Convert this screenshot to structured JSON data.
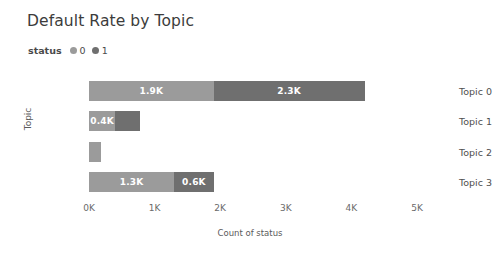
{
  "chart_data": {
    "type": "bar",
    "orientation": "horizontal",
    "stacked": true,
    "title": "Default Rate by Topic",
    "xlabel": "Count of status",
    "ylabel": "Topic",
    "categories": [
      "Topic 0",
      "Topic 1",
      "Topic 2",
      "Topic 3"
    ],
    "xlim": [
      0,
      5000
    ],
    "xticks": [
      0,
      1000,
      2000,
      3000,
      4000,
      5000
    ],
    "xtick_labels": [
      "0K",
      "1K",
      "2K",
      "3K",
      "4K",
      "5K"
    ],
    "grid": false,
    "legend": {
      "title": "status",
      "position": "top-left",
      "entries": [
        {
          "label": "0",
          "color": "#9b9b9b"
        },
        {
          "label": "1",
          "color": "#6f6f6f"
        }
      ]
    },
    "series": [
      {
        "name": "0",
        "color": "#9b9b9b",
        "values": [
          1900,
          400,
          180,
          1300
        ],
        "data_labels": [
          "1.9K",
          "0.4K",
          "",
          "1.3K"
        ]
      },
      {
        "name": "1",
        "color": "#6f6f6f",
        "values": [
          2300,
          380,
          0,
          600
        ],
        "data_labels": [
          "2.3K",
          "",
          "",
          "0.6K"
        ]
      }
    ]
  }
}
